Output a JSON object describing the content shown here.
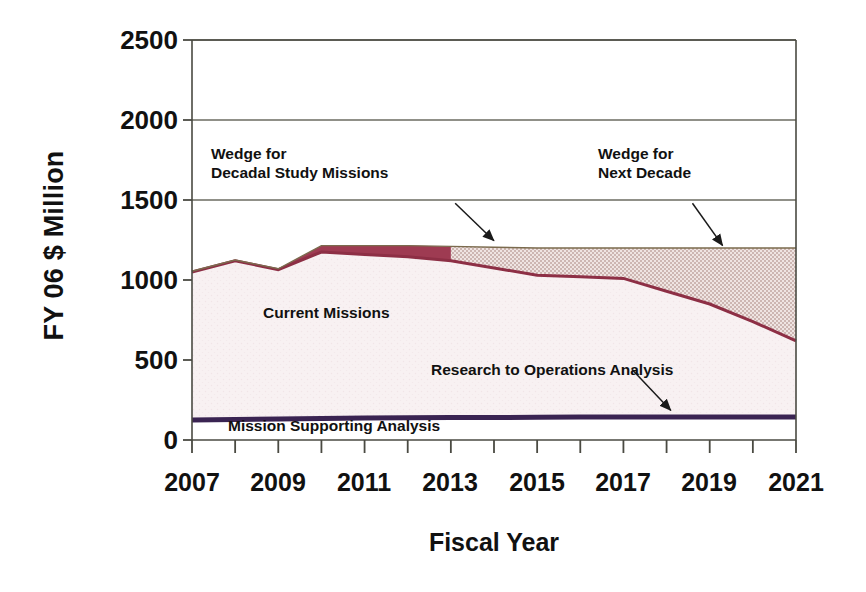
{
  "chart_data": {
    "type": "area",
    "title": "",
    "xlabel": "Fiscal Year",
    "ylabel": "FY 06 $ Million",
    "xlim": [
      2007,
      2021
    ],
    "ylim": [
      0,
      2500
    ],
    "ytick_labels": [
      "2500",
      "2000",
      "1500",
      "1000",
      "500",
      "0"
    ],
    "ytick_values": [
      2500,
      2000,
      1500,
      1000,
      500,
      0
    ],
    "xtick_labels": [
      "2007",
      "2009",
      "2011",
      "2013",
      "2015",
      "2017",
      "2019",
      "2021"
    ],
    "xtick_values": [
      2007,
      2009,
      2011,
      2013,
      2015,
      2017,
      2019,
      2021
    ],
    "minor_xticks": [
      2008,
      2010,
      2012,
      2014,
      2016,
      2018,
      2020
    ],
    "grid": "horizontal",
    "legend_position": "inline-annotations",
    "x": [
      2007,
      2008,
      2009,
      2010,
      2011,
      2012,
      2013,
      2014,
      2015,
      2016,
      2017,
      2018,
      2019,
      2020,
      2021
    ],
    "series": [
      {
        "name": "Mission Supporting Analysis",
        "color": "#3a2452",
        "values": [
          125,
          128,
          131,
          134,
          137,
          139,
          140,
          141,
          142,
          143,
          144,
          144,
          144,
          144,
          144
        ]
      },
      {
        "name": "Current Missions",
        "color": "#f6eef0",
        "values": [
          1050,
          1120,
          1065,
          1175,
          1160,
          1145,
          1120,
          1075,
          1030,
          1020,
          1010,
          930,
          850,
          740,
          620
        ]
      },
      {
        "name": "Wedge for Decadal Study Missions",
        "color": "#9e3b52",
        "values": [
          1055,
          1125,
          1070,
          1215,
          1215,
          1215,
          1210,
          1205,
          1200,
          1200,
          1200,
          1200,
          1200,
          1200,
          1200
        ]
      },
      {
        "name": "Wedge for Next Decade",
        "color": "#d9c7c4",
        "values": [
          null,
          null,
          null,
          null,
          null,
          null,
          1210,
          1205,
          1200,
          1200,
          1200,
          1200,
          1200,
          1200,
          1200
        ]
      }
    ],
    "annotations": [
      {
        "id": "decadal-wedge",
        "text_line1": "Wedge for",
        "text_line2": "Decadal Study Missions",
        "arrow_from": [
          2013.1,
          1480
        ],
        "arrow_to": [
          2014.0,
          1245
        ]
      },
      {
        "id": "next-decade-wedge",
        "text_line1": "Wedge for",
        "text_line2": "Next Decade",
        "arrow_from": [
          2018.6,
          1480
        ],
        "arrow_to": [
          2019.3,
          1215
        ]
      },
      {
        "id": "current-missions",
        "text_line1": "Current Missions",
        "text_line2": ""
      },
      {
        "id": "research-ops",
        "text_line1": "Research to Operations Analysis",
        "text_line2": "",
        "arrow_from": [
          2017.2,
          440
        ],
        "arrow_to": [
          2018.1,
          185
        ]
      },
      {
        "id": "mission-support",
        "text_line1": "Mission Supporting Analysis",
        "text_line2": ""
      }
    ],
    "colors": {
      "wedge_decadal": "#9e3b52",
      "wedge_next_decade": "#d9c7c4",
      "current_missions": "#f6eef0",
      "mission_support": "#3a2452",
      "axis": "#4a4a42",
      "grid": "#6b6b60",
      "text": "#111111",
      "background": "#ffffff"
    }
  }
}
